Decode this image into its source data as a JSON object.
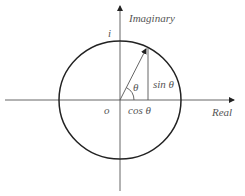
{
  "diagram": {
    "labels": {
      "imaginary_axis": "Imaginary",
      "real_axis": "Real",
      "i_label": "i",
      "origin": "o",
      "theta": "θ",
      "sin": "sin θ",
      "cos": "cos θ"
    },
    "colors": {
      "circle": "#222222",
      "axes": "#444444",
      "text": "#555555",
      "background": "#ffffff"
    },
    "geometry": {
      "center": [
        120,
        100
      ],
      "radius": 60,
      "vector_tip": [
        147,
        48
      ]
    }
  }
}
